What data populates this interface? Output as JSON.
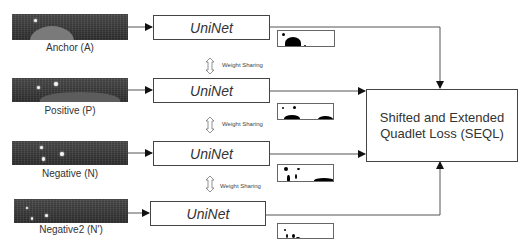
{
  "inputs": [
    {
      "label": "Anchor (A)"
    },
    {
      "label": "Positive (P)"
    },
    {
      "label": "Negative (N)"
    },
    {
      "label": "Negative2 (N')"
    }
  ],
  "network": {
    "label": "UniNet"
  },
  "weight_sharing": {
    "label": "Weight Sharing"
  },
  "loss": {
    "line1": "Shifted and Extended",
    "line2": "Quadlet Loss (SEQL)"
  },
  "colors": {
    "line": "#555555",
    "box_border": "#444444",
    "text": "#333333"
  }
}
